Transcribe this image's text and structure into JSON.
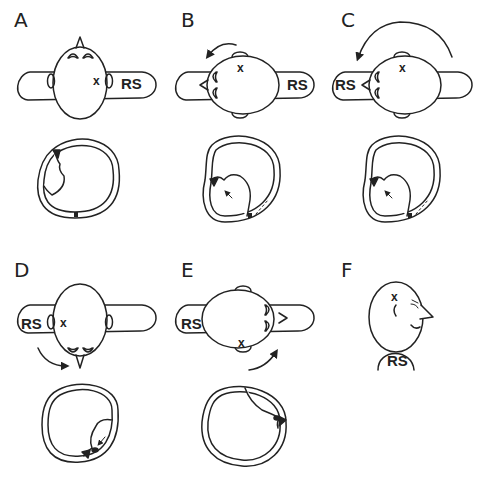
{
  "figure": {
    "panels": [
      {
        "id": "A",
        "label": "A",
        "side_label": "RS",
        "marker": "x",
        "rotation_arrow": "none"
      },
      {
        "id": "B",
        "label": "B",
        "side_label": "RS",
        "marker": "x",
        "rotation_arrow": "counterclockwise-small"
      },
      {
        "id": "C",
        "label": "C",
        "side_label": "RS",
        "marker": "x",
        "rotation_arrow": "counterclockwise-large"
      },
      {
        "id": "D",
        "label": "D",
        "side_label": "RS",
        "marker": "x",
        "rotation_arrow": "clockwise-down"
      },
      {
        "id": "E",
        "label": "E",
        "side_label": "RS",
        "marker": "x",
        "rotation_arrow": "clockwise-up"
      },
      {
        "id": "F",
        "label": "F",
        "side_label": "RS",
        "marker": "x",
        "rotation_arrow": "none"
      }
    ],
    "colors": {
      "stroke": "#222222",
      "background": "#ffffff"
    }
  }
}
